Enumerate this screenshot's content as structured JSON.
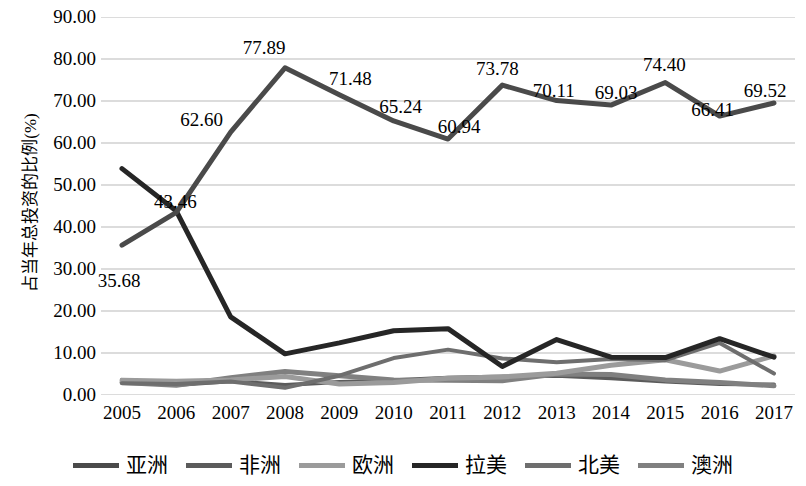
{
  "chart_data": {
    "type": "line",
    "title": "",
    "xlabel": "",
    "ylabel": "占当年总投资的比例(%)",
    "x": [
      "2005",
      "2006",
      "2007",
      "2008",
      "2009",
      "2010",
      "2011",
      "2012",
      "2013",
      "2014",
      "2015",
      "2016",
      "2017"
    ],
    "ylim": [
      0,
      90
    ],
    "ytick_labels": [
      "90.00",
      "80.00",
      "70.00",
      "60.00",
      "50.00",
      "40.00",
      "30.00",
      "20.00",
      "10.00",
      "0.00"
    ],
    "ytick_values": [
      90,
      80,
      70,
      60,
      50,
      40,
      30,
      20,
      10,
      0
    ],
    "grid": true,
    "legend_position": "bottom",
    "series": [
      {
        "name": "亚洲",
        "color": "#4a4a4a",
        "width": 5,
        "labeled": true,
        "values": [
          35.68,
          43.46,
          62.6,
          77.89,
          71.48,
          65.24,
          60.94,
          73.78,
          70.11,
          69.03,
          74.4,
          66.41,
          69.52
        ],
        "labels": [
          "35.68",
          "43.46",
          "62.60",
          "77.89",
          "71.48",
          "65.24",
          "60.94",
          "73.78",
          "70.11",
          "69.03",
          "74.40",
          "66.41",
          "69.52"
        ]
      },
      {
        "name": "非洲",
        "color": "#5b5b5b",
        "width": 4,
        "labeled": false,
        "values": [
          3.6,
          2.4,
          3.3,
          2.4,
          3.1,
          3.5,
          4.1,
          4.4,
          4.6,
          4.0,
          3.2,
          2.6,
          2.5
        ]
      },
      {
        "name": "欧洲",
        "color": "#9b9b9b",
        "width": 5,
        "labeled": false,
        "values": [
          3.5,
          3.3,
          3.6,
          4.4,
          2.6,
          3.0,
          4.0,
          4.3,
          5.2,
          7.1,
          8.4,
          5.7,
          9.3
        ]
      },
      {
        "name": "拉美",
        "color": "#262626",
        "width": 5,
        "labeled": false,
        "values": [
          53.9,
          43.8,
          18.6,
          9.8,
          12.4,
          15.3,
          15.8,
          6.8,
          13.2,
          9.0,
          8.9,
          13.4,
          9.0
        ]
      },
      {
        "name": "北美",
        "color": "#6e6e6e",
        "width": 4,
        "labeled": false,
        "values": [
          2.8,
          2.6,
          3.2,
          1.7,
          4.6,
          8.8,
          10.8,
          8.7,
          7.8,
          8.6,
          8.3,
          12.4,
          5.1
        ]
      },
      {
        "name": "澳洲",
        "color": "#808080",
        "width": 5,
        "labeled": false,
        "values": [
          3.0,
          2.3,
          4.1,
          5.6,
          4.6,
          3.6,
          3.5,
          3.4,
          5.0,
          4.9,
          3.6,
          3.0,
          2.2
        ]
      }
    ]
  },
  "axis": {
    "ylabel": "占当年总投资的比例(%)"
  }
}
